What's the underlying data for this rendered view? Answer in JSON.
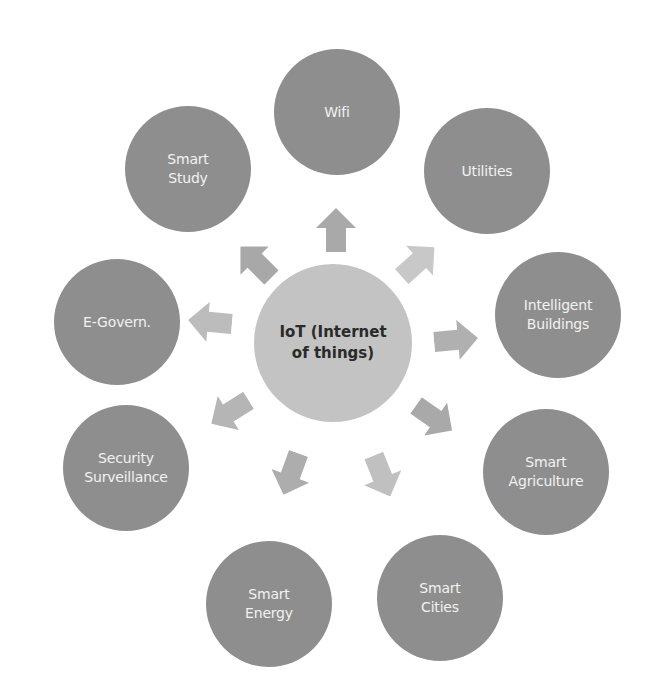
{
  "diagram": {
    "title": "IoT (Internet of things)",
    "center": {
      "label": "IoT (Internet\nof things)",
      "x": 333,
      "y": 343,
      "color": "#c3c3c3",
      "text_color": "#2a2a2a"
    },
    "node_color": "#8e8e8e",
    "node_text_color": "#f2f2f2",
    "nodes": [
      {
        "id": "wifi",
        "label": "Wifi",
        "x": 337,
        "y": 112
      },
      {
        "id": "utilities",
        "label": "Utilities",
        "x": 487,
        "y": 171
      },
      {
        "id": "intelligent-buildings",
        "label": "Intelligent\nBuildings",
        "x": 558,
        "y": 315
      },
      {
        "id": "smart-agriculture",
        "label": "Smart\nAgriculture",
        "x": 546,
        "y": 472
      },
      {
        "id": "smart-cities",
        "label": "Smart\nCities",
        "x": 440,
        "y": 598
      },
      {
        "id": "smart-energy",
        "label": "Smart\nEnergy",
        "x": 269,
        "y": 604
      },
      {
        "id": "security-surveillance",
        "label": "Security\nSurveillance",
        "x": 126,
        "y": 468
      },
      {
        "id": "e-govern",
        "label": "E-Govern.",
        "x": 117,
        "y": 322
      },
      {
        "id": "smart-study",
        "label": "Smart\nStudy",
        "x": 188,
        "y": 169
      }
    ],
    "arrows": [
      {
        "target": "wifi",
        "x": 336,
        "y": 230,
        "angle": -90,
        "color": "#a9a9a9"
      },
      {
        "target": "utilities",
        "x": 418,
        "y": 262,
        "angle": -42,
        "color": "#c8c8c8"
      },
      {
        "target": "intelligent-buildings",
        "x": 456,
        "y": 340,
        "angle": -5,
        "color": "#b0b0b0"
      },
      {
        "target": "smart-agriculture",
        "x": 434,
        "y": 418,
        "angle": 35,
        "color": "#a9a9a9"
      },
      {
        "target": "smart-cities",
        "x": 382,
        "y": 476,
        "angle": 68,
        "color": "#c0c0c0"
      },
      {
        "target": "smart-energy",
        "x": 291,
        "y": 474,
        "angle": 110,
        "color": "#adadad"
      },
      {
        "target": "security-surveillance",
        "x": 230,
        "y": 412,
        "angle": 148,
        "color": "#b5b5b5"
      },
      {
        "target": "e-govern",
        "x": 210,
        "y": 322,
        "angle": 185,
        "color": "#bcbcbc"
      },
      {
        "target": "smart-study",
        "x": 256,
        "y": 262,
        "angle": 225,
        "color": "#a8a8a8"
      }
    ]
  }
}
